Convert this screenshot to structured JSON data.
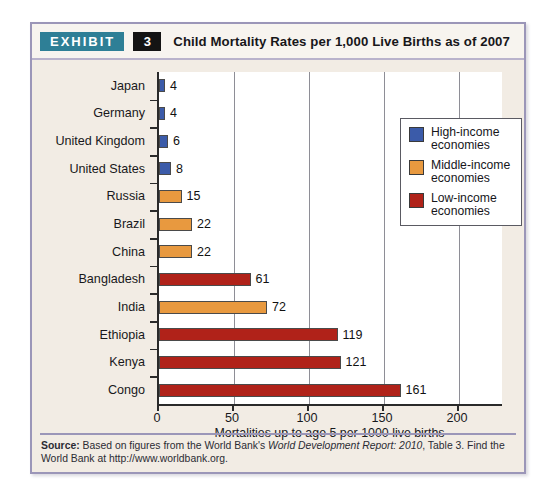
{
  "exhibit": {
    "tag_label": "EXHIBIT",
    "number": "3",
    "title": "Child Mortality Rates per 1,000 Live Births as of 2007"
  },
  "source": {
    "label": "Source:",
    "text_before_italic": " Based on figures from the World Bank's ",
    "italic_text": "World Development Report: 2010",
    "text_after_italic": ", Table 3. Find the World Bank at http://www.worldbank.org."
  },
  "colors": {
    "high_income": "#3b5ba9",
    "middle_income": "#e8993f",
    "low_income": "#b02219",
    "frame": "#9b96b8",
    "card_background": "#f2ece4",
    "plot_background": "#ffffff",
    "tag_background": "#2e7f96",
    "number_background": "#141414",
    "axis": "#2a2a2a",
    "gridline": "#8e8e96"
  },
  "legend": {
    "items": [
      {
        "label": "High-income economies",
        "color": "#3b5ba9",
        "swatch_name": "high-income-swatch"
      },
      {
        "label": "Middle-income economies",
        "color": "#e8993f",
        "swatch_name": "middle-income-swatch"
      },
      {
        "label": "Low-income economies",
        "color": "#b02219",
        "swatch_name": "low-income-swatch"
      }
    ]
  },
  "chart_data": {
    "type": "bar",
    "orientation": "horizontal",
    "title": "Child Mortality Rates per 1,000 Live Births as of 2007",
    "xlabel": "Mortalities up to age 5 per 1000 live births",
    "ylabel": "",
    "xlim": [
      0,
      230
    ],
    "xticks": [
      0,
      50,
      100,
      150,
      200
    ],
    "xtick_labels": [
      "0",
      "50",
      "100",
      "150",
      "200"
    ],
    "grid": "vertical",
    "legend_position": "top-right",
    "categories": [
      "Japan",
      "Germany",
      "United Kingdom",
      "United States",
      "Russia",
      "Brazil",
      "China",
      "Bangladesh",
      "India",
      "Ethiopia",
      "Kenya",
      "Congo"
    ],
    "values": [
      4,
      4,
      6,
      8,
      15,
      22,
      22,
      61,
      72,
      119,
      121,
      161
    ],
    "value_labels": [
      "4",
      "4",
      "6",
      "8",
      "15",
      "22",
      "22",
      "61",
      "72",
      "119",
      "121",
      "161"
    ],
    "groups": [
      "high_income",
      "high_income",
      "high_income",
      "high_income",
      "middle_income",
      "middle_income",
      "middle_income",
      "low_income",
      "middle_income",
      "low_income",
      "low_income",
      "low_income"
    ],
    "series": [
      {
        "name": "High-income economies",
        "color": "#3b5ba9",
        "points": [
          {
            "category": "Japan",
            "value": 4
          },
          {
            "category": "Germany",
            "value": 4
          },
          {
            "category": "United Kingdom",
            "value": 6
          },
          {
            "category": "United States",
            "value": 8
          }
        ]
      },
      {
        "name": "Middle-income economies",
        "color": "#e8993f",
        "points": [
          {
            "category": "Russia",
            "value": 15
          },
          {
            "category": "Brazil",
            "value": 22
          },
          {
            "category": "China",
            "value": 22
          },
          {
            "category": "India",
            "value": 72
          }
        ]
      },
      {
        "name": "Low-income economies",
        "color": "#b02219",
        "points": [
          {
            "category": "Bangladesh",
            "value": 61
          },
          {
            "category": "Ethiopia",
            "value": 119
          },
          {
            "category": "Kenya",
            "value": 121
          },
          {
            "category": "Congo",
            "value": 161
          }
        ]
      }
    ]
  }
}
